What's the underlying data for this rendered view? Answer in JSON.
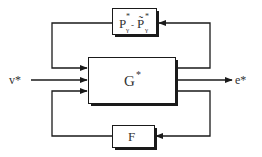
{
  "diagram": {
    "type": "block-diagram",
    "colors": {
      "line": "#1a1a1a",
      "text": "#333333",
      "background": "#ffffff",
      "shadow": "#1a1a1a"
    },
    "blocks": {
      "top": {
        "label_main": "P",
        "label_sup1": "*",
        "label_sub1": "γ",
        "label_sep": "-",
        "label_main2": "P̃",
        "label_sup2": "*",
        "label_sub2": "γ"
      },
      "center": {
        "label": "G",
        "sup": "*"
      },
      "bottom": {
        "label": "F"
      }
    },
    "signals": {
      "input": "v*",
      "output": "e*"
    },
    "edges": [
      {
        "from": "G",
        "to": "P̃γ* block",
        "path": "right loop, top"
      },
      {
        "from": "P block",
        "to": "G",
        "path": "left loop, top"
      },
      {
        "from": "v*",
        "to": "G"
      },
      {
        "from": "G",
        "to": "e*"
      },
      {
        "from": "G",
        "to": "F",
        "path": "right loop, bottom"
      },
      {
        "from": "F",
        "to": "G",
        "path": "left loop, bottom"
      }
    ]
  }
}
